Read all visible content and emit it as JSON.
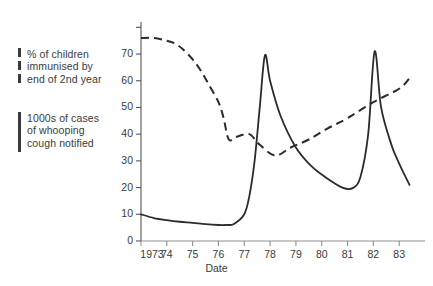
{
  "figure": {
    "background_color": "#ffffff",
    "ink_color": "#3a3a3a"
  },
  "legend": {
    "position": "left",
    "entries": [
      {
        "name": "immunisation",
        "marker": "dashed-line-swatch",
        "label": "% of children\nimmunised by\nend of 2nd year"
      },
      {
        "name": "cases",
        "marker": "solid-line-swatch",
        "label": "1000s of cases\nof whooping\ncough notified"
      }
    ]
  },
  "axes": {
    "x_label": "Date",
    "y_label": "",
    "x_tick_labels": [
      "1973",
      "74",
      "75",
      "76",
      "77",
      "78",
      "79",
      "80",
      "81",
      "82",
      "83"
    ],
    "y_tick_labels": [
      "0",
      "10",
      "20",
      "30",
      "40",
      "50",
      "60",
      "70"
    ]
  },
  "chart_data": {
    "type": "line",
    "title": "",
    "subtitle": "",
    "xlabel": "Date",
    "ylabel": "",
    "xlim": [
      1973,
      1984
    ],
    "ylim": [
      0,
      82
    ],
    "grid": false,
    "legend_position": "left-outside",
    "x_ticks": [
      1973,
      1974,
      1975,
      1976,
      1977,
      1978,
      1979,
      1980,
      1981,
      1982,
      1983
    ],
    "x_tick_labels": [
      "1973",
      "74",
      "75",
      "76",
      "77",
      "78",
      "79",
      "80",
      "81",
      "82",
      "83"
    ],
    "y_ticks": [
      0,
      10,
      20,
      30,
      40,
      50,
      60,
      70
    ],
    "y_ticks_unlabeled": [
      80
    ],
    "series": [
      {
        "name": "% of children immunised by end of 2nd year",
        "style": "dashed",
        "units": "percent",
        "points": [
          [
            1973.0,
            76
          ],
          [
            1973.5,
            76
          ],
          [
            1974.0,
            75
          ],
          [
            1974.3,
            74
          ],
          [
            1974.6,
            72
          ],
          [
            1975.0,
            68
          ],
          [
            1975.3,
            64
          ],
          [
            1975.6,
            59
          ],
          [
            1976.0,
            52
          ],
          [
            1976.2,
            46
          ],
          [
            1976.4,
            38
          ],
          [
            1976.7,
            39
          ],
          [
            1977.2,
            40
          ],
          [
            1977.6,
            36
          ],
          [
            1978.2,
            32
          ],
          [
            1978.8,
            35
          ],
          [
            1979.5,
            38
          ],
          [
            1980.2,
            42
          ],
          [
            1981.0,
            46
          ],
          [
            1982.0,
            52
          ],
          [
            1983.0,
            57
          ],
          [
            1983.4,
            61
          ]
        ]
      },
      {
        "name": "1000s of cases of whooping cough notified",
        "style": "solid",
        "units": "thousands of cases",
        "points": [
          [
            1973.0,
            10
          ],
          [
            1973.5,
            8.6
          ],
          [
            1974.0,
            7.8
          ],
          [
            1974.5,
            7.2
          ],
          [
            1975.0,
            6.8
          ],
          [
            1975.5,
            6.3
          ],
          [
            1976.0,
            6.0
          ],
          [
            1976.3,
            6.0
          ],
          [
            1976.6,
            6.4
          ],
          [
            1977.0,
            10
          ],
          [
            1977.2,
            17
          ],
          [
            1977.4,
            30
          ],
          [
            1977.6,
            50
          ],
          [
            1977.8,
            69.5
          ],
          [
            1978.0,
            60
          ],
          [
            1978.4,
            47
          ],
          [
            1979.0,
            35
          ],
          [
            1979.6,
            28
          ],
          [
            1980.2,
            23.5
          ],
          [
            1980.8,
            20
          ],
          [
            1981.2,
            19.8
          ],
          [
            1981.5,
            24
          ],
          [
            1981.8,
            40
          ],
          [
            1982.05,
            71
          ],
          [
            1982.3,
            50
          ],
          [
            1982.7,
            36
          ],
          [
            1983.0,
            29
          ],
          [
            1983.4,
            21
          ]
        ]
      }
    ]
  }
}
